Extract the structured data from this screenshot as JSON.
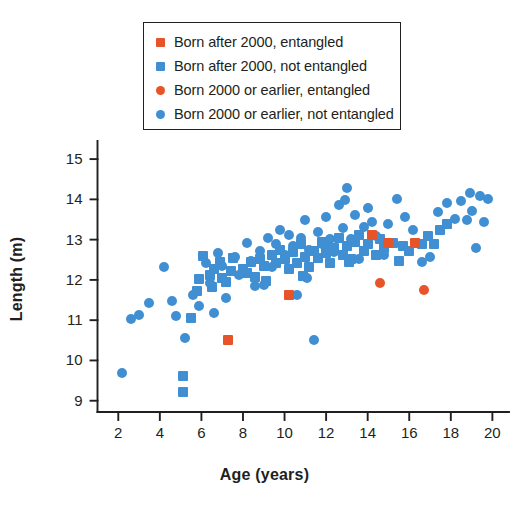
{
  "figure": {
    "background": "#ffffff",
    "colors": {
      "blue": "#3f8fd2",
      "orange": "#e7542a",
      "axis": "#231f20",
      "text": "#231f20"
    }
  },
  "legend": {
    "position": "top-center",
    "bordered": true,
    "entries": [
      {
        "label": "Born after 2000, entangled",
        "marker": "square",
        "color": "#e7542a",
        "series_key": "after2000_entangled"
      },
      {
        "label": "Born after 2000, not entangled",
        "marker": "square",
        "color": "#3f8fd2",
        "series_key": "after2000_not_entangled"
      },
      {
        "label": "Born 2000 or earlier, entangled",
        "marker": "circle",
        "color": "#e7542a",
        "series_key": "pre2000_entangled"
      },
      {
        "label": "Born 2000 or earlier, not entangled",
        "marker": "circle",
        "color": "#3f8fd2",
        "series_key": "pre2000_not_entangled"
      }
    ]
  },
  "axes": {
    "x": {
      "label": "Age (years)",
      "ticks": [
        2,
        4,
        6,
        8,
        10,
        12,
        14,
        16,
        18,
        20
      ],
      "tick_labels": [
        "2",
        "4",
        "6",
        "8",
        "10",
        "12",
        "14",
        "16",
        "18",
        "20"
      ],
      "min": 1.0,
      "max": 20.8
    },
    "y": {
      "label": "Length (m)",
      "ticks": [
        9,
        10,
        11,
        12,
        13,
        14,
        15
      ],
      "tick_labels": [
        "9",
        "10",
        "11",
        "12",
        "13",
        "14",
        "15"
      ],
      "min": 8.72,
      "max": 15.35
    },
    "grid": false,
    "spines": [
      "left",
      "bottom"
    ]
  },
  "chart_data": {
    "type": "scatter",
    "title": "",
    "xlabel": "Age (years)",
    "ylabel": "Length (m)",
    "xlim": [
      1.0,
      20.8
    ],
    "ylim": [
      8.72,
      15.35
    ],
    "grid": false,
    "legend_position": "top-center",
    "series": [
      {
        "name": "Born after 2000, entangled",
        "key": "after2000_entangled",
        "marker": "square",
        "color": "#e7542a",
        "points": [
          [
            7.3,
            10.52
          ],
          [
            10.2,
            11.62
          ],
          [
            14.2,
            13.12
          ],
          [
            15.0,
            12.92
          ],
          [
            16.3,
            12.92
          ]
        ]
      },
      {
        "name": "Born after 2000, not entangled",
        "key": "after2000_not_entangled",
        "marker": "square",
        "color": "#3f8fd2",
        "points": [
          [
            5.1,
            9.62
          ],
          [
            5.1,
            9.22
          ],
          [
            5.5,
            11.05
          ],
          [
            5.8,
            11.72
          ],
          [
            5.9,
            12.02
          ],
          [
            6.4,
            12.12
          ],
          [
            6.5,
            11.82
          ],
          [
            6.6,
            12.28
          ],
          [
            6.9,
            12.45
          ],
          [
            7.0,
            12.05
          ],
          [
            7.2,
            11.95
          ],
          [
            7.4,
            12.22
          ],
          [
            7.5,
            12.55
          ],
          [
            8.0,
            12.28
          ],
          [
            8.2,
            12.18
          ],
          [
            8.4,
            12.45
          ],
          [
            8.6,
            12.08
          ],
          [
            8.8,
            12.52
          ],
          [
            9.0,
            12.35
          ],
          [
            9.1,
            11.98
          ],
          [
            9.4,
            12.62
          ],
          [
            9.6,
            12.42
          ],
          [
            9.8,
            12.75
          ],
          [
            10.0,
            12.52
          ],
          [
            10.2,
            12.28
          ],
          [
            10.4,
            12.7
          ],
          [
            10.6,
            12.42
          ],
          [
            10.8,
            12.88
          ],
          [
            11.0,
            12.58
          ],
          [
            11.2,
            12.32
          ],
          [
            11.4,
            12.72
          ],
          [
            11.6,
            12.55
          ],
          [
            11.8,
            12.95
          ],
          [
            12.0,
            12.68
          ],
          [
            12.2,
            12.42
          ],
          [
            12.4,
            12.78
          ],
          [
            12.6,
            13.05
          ],
          [
            12.8,
            12.62
          ],
          [
            13.0,
            12.85
          ],
          [
            13.2,
            12.52
          ],
          [
            13.4,
            12.95
          ],
          [
            13.6,
            13.12
          ],
          [
            13.8,
            12.72
          ],
          [
            14.0,
            12.88
          ],
          [
            14.4,
            12.62
          ],
          [
            14.6,
            13.02
          ],
          [
            14.8,
            12.78
          ],
          [
            15.2,
            12.92
          ],
          [
            15.5,
            12.48
          ],
          [
            15.7,
            12.85
          ],
          [
            16.0,
            12.72
          ],
          [
            16.6,
            12.88
          ],
          [
            16.9,
            13.08
          ],
          [
            17.2,
            12.9
          ],
          [
            17.5,
            13.25
          ],
          [
            17.8,
            13.38
          ],
          [
            6.1,
            12.6
          ],
          [
            10.9,
            12.1
          ],
          [
            12.1,
            12.88
          ],
          [
            13.1,
            12.45
          ]
        ]
      },
      {
        "name": "Born 2000 or earlier, entangled",
        "key": "pre2000_entangled",
        "marker": "circle",
        "color": "#e7542a",
        "points": [
          [
            14.6,
            11.92
          ],
          [
            16.7,
            11.75
          ]
        ]
      },
      {
        "name": "Born 2000 or earlier, not entangled",
        "key": "pre2000_not_entangled",
        "marker": "circle",
        "color": "#3f8fd2",
        "points": [
          [
            2.2,
            9.68
          ],
          [
            2.6,
            11.02
          ],
          [
            3.0,
            11.12
          ],
          [
            3.5,
            11.42
          ],
          [
            4.2,
            12.32
          ],
          [
            4.6,
            11.48
          ],
          [
            4.8,
            11.1
          ],
          [
            5.2,
            10.55
          ],
          [
            5.6,
            11.62
          ],
          [
            5.9,
            11.35
          ],
          [
            6.2,
            12.42
          ],
          [
            6.4,
            11.92
          ],
          [
            6.6,
            11.18
          ],
          [
            6.8,
            12.68
          ],
          [
            7.0,
            12.35
          ],
          [
            7.2,
            11.55
          ],
          [
            7.6,
            12.58
          ],
          [
            7.8,
            12.12
          ],
          [
            8.2,
            12.92
          ],
          [
            8.4,
            12.48
          ],
          [
            8.6,
            11.85
          ],
          [
            8.8,
            12.72
          ],
          [
            9.2,
            13.05
          ],
          [
            9.4,
            12.32
          ],
          [
            9.6,
            12.88
          ],
          [
            9.8,
            13.25
          ],
          [
            10.0,
            12.62
          ],
          [
            10.2,
            13.12
          ],
          [
            10.4,
            12.85
          ],
          [
            10.6,
            11.62
          ],
          [
            10.8,
            13.05
          ],
          [
            11.0,
            13.48
          ],
          [
            11.2,
            12.75
          ],
          [
            11.4,
            10.52
          ],
          [
            11.6,
            13.18
          ],
          [
            11.8,
            12.88
          ],
          [
            12.0,
            13.55
          ],
          [
            12.2,
            13.02
          ],
          [
            12.4,
            12.7
          ],
          [
            12.6,
            13.85
          ],
          [
            12.8,
            13.28
          ],
          [
            13.0,
            14.28
          ],
          [
            13.2,
            13.02
          ],
          [
            13.4,
            13.62
          ],
          [
            13.6,
            12.52
          ],
          [
            13.8,
            13.32
          ],
          [
            14.0,
            13.78
          ],
          [
            14.2,
            13.45
          ],
          [
            14.4,
            13.08
          ],
          [
            14.8,
            12.62
          ],
          [
            15.0,
            13.38
          ],
          [
            15.4,
            14.02
          ],
          [
            15.8,
            13.55
          ],
          [
            16.2,
            13.25
          ],
          [
            16.6,
            12.45
          ],
          [
            17.0,
            12.58
          ],
          [
            17.4,
            13.68
          ],
          [
            17.8,
            13.92
          ],
          [
            18.2,
            13.52
          ],
          [
            18.5,
            13.95
          ],
          [
            18.8,
            13.48
          ],
          [
            19.0,
            13.72
          ],
          [
            19.2,
            12.78
          ],
          [
            19.4,
            14.08
          ],
          [
            19.6,
            13.45
          ],
          [
            19.8,
            14.02
          ],
          [
            18.9,
            14.15
          ],
          [
            12.9,
            13.98
          ],
          [
            11.1,
            12.05
          ],
          [
            9.0,
            11.88
          ]
        ]
      }
    ]
  }
}
